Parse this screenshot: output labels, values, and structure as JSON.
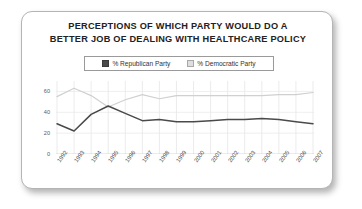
{
  "card": {
    "title_line_1": "PERCEPTIONS OF WHICH PARTY WOULD DO A",
    "title_line_2": "BETTER JOB OF DEALING WITH HEALTHCARE POLICY"
  },
  "legend": {
    "position": "top-center",
    "items": [
      {
        "label": "% Republican Party",
        "color": "#4a4a4a",
        "icon": "legend-swatch-icon"
      },
      {
        "label": "% Democratic Party",
        "color": "#d8d8d8",
        "icon": "legend-swatch-icon"
      }
    ]
  },
  "chart_data": {
    "type": "line",
    "title": "PERCEPTIONS OF WHICH PARTY WOULD DO A BETTER JOB OF DEALING WITH HEALTHCARE POLICY",
    "xlabel": "",
    "ylabel": "",
    "ylim": [
      0,
      70
    ],
    "yticks": [
      0,
      20,
      40,
      60
    ],
    "ytick_labels": [
      "0",
      "20",
      "40",
      "60"
    ],
    "categories": [
      "1992",
      "1993",
      "1994",
      "1995",
      "1996",
      "1997",
      "1998",
      "1999",
      "2000",
      "2001",
      "2002",
      "2003",
      "2004",
      "2005",
      "2006",
      "2007"
    ],
    "x": [
      1992,
      1993,
      1994,
      1995,
      1996,
      1997,
      1998,
      1999,
      2000,
      2001,
      2002,
      2003,
      2004,
      2005,
      2006,
      2007
    ],
    "grid": true,
    "grid_axis": "both",
    "series": [
      {
        "name": "% Republican Party",
        "color": "#4a4a4a",
        "values": [
          29,
          22,
          38,
          46,
          39,
          32,
          33,
          31,
          31,
          32,
          33,
          33,
          34,
          33,
          31,
          29
        ]
      },
      {
        "name": "% Democratic Party",
        "color": "#d0d0d0",
        "values": [
          55,
          63,
          56,
          45,
          52,
          57,
          53,
          56,
          56,
          56,
          56,
          56,
          56,
          57,
          57,
          59
        ]
      }
    ]
  }
}
